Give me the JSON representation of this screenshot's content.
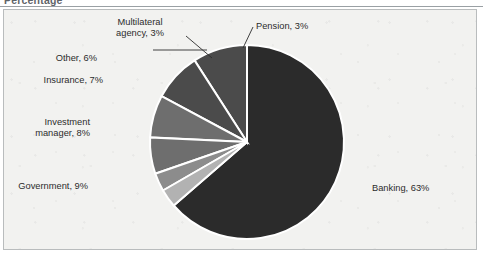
{
  "figure": {
    "title": "Percentage"
  },
  "chart_data": {
    "type": "pie",
    "title": "Percentage",
    "xlabel": "",
    "ylabel": "",
    "units": "percent",
    "legend_position": "none",
    "grid": false,
    "start_angle_deg": 0,
    "direction": "clockwise",
    "categories": [
      "Banking",
      "Government",
      "Investment manager",
      "Insurance",
      "Other",
      "Multilateral agency",
      "Pension"
    ],
    "values": [
      63,
      9,
      8,
      7,
      6,
      3,
      3
    ],
    "slices": [
      {
        "name": "Banking",
        "value": 63,
        "label": "Banking, 63%",
        "color": "#2b2b2b",
        "label_anchor": "left",
        "label_x": 372,
        "label_y": 183,
        "leader": false
      },
      {
        "name": "Government",
        "value": 9,
        "label": "Government, 9%",
        "color": "#4b4b4b",
        "label_anchor": "right",
        "label_x": 88,
        "label_y": 181,
        "leader": false
      },
      {
        "name": "Investment manager",
        "value": 8,
        "label": "Investment manager, 8%",
        "label_line1": "Investment",
        "label_line2": "manager, 8%",
        "color": "#4b4b4b",
        "label_anchor": "right",
        "label_x": 90,
        "label_y": 117,
        "leader": false
      },
      {
        "name": "Insurance",
        "value": 7,
        "label": "Insurance, 7%",
        "color": "#6e6e6e",
        "label_anchor": "right",
        "label_x": 103,
        "label_y": 75,
        "leader": false
      },
      {
        "name": "Other",
        "value": 6,
        "label": "Other, 6%",
        "color": "#6e6e6e",
        "label_anchor": "right",
        "label_x": 97,
        "label_y": 53,
        "leader": true
      },
      {
        "name": "Multilateral agency",
        "value": 3,
        "label": "Multilateral agency, 3%",
        "label_line1": "Multilateral",
        "label_line2": "agency, 3%",
        "color": "#8c8c8c",
        "label_anchor": "center",
        "label_x": 140,
        "label_y": 17,
        "leader": true
      },
      {
        "name": "Pension",
        "value": 3,
        "label": "Pension, 3%",
        "color": "#b2b2b2",
        "label_anchor": "left",
        "label_x": 256,
        "label_y": 21,
        "leader": true
      }
    ],
    "geometry": {
      "center_x": 247,
      "center_y": 142,
      "radius": 97,
      "separator_color": "#ffffff",
      "separator_width": 2
    },
    "colors": {
      "banking": "#2b2b2b",
      "government": "#4b4b4b",
      "investment_manager": "#4b4b4b",
      "insurance": "#6e6e6e",
      "other": "#6e6e6e",
      "multilateral_agency": "#8c8c8c",
      "pension": "#b2b2b2",
      "plot_background": "#f2f2f0",
      "frame_border": "#b9bcbd",
      "title_color": "#5f6468",
      "label_color": "#2c2c2c"
    }
  }
}
